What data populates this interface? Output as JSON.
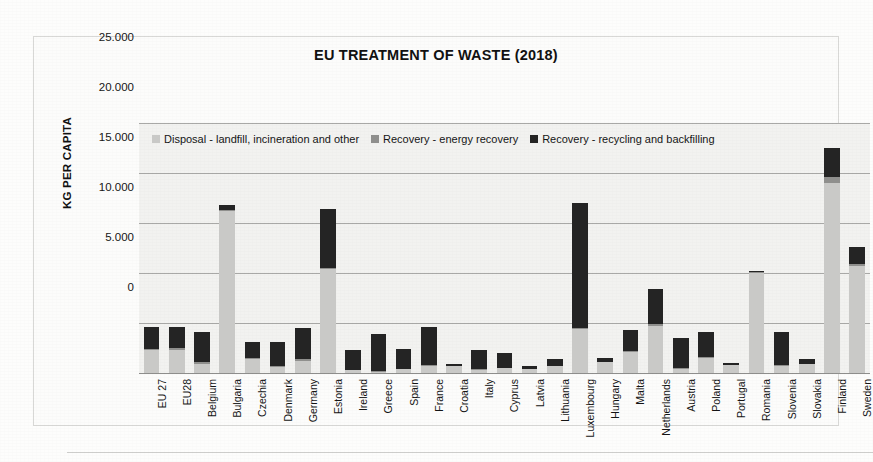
{
  "chart_data": {
    "type": "bar",
    "subtype": "stacked-column",
    "title": "EU TREATMENT OF WASTE (2018)",
    "xlabel": "",
    "ylabel": "KG PER CAPITA",
    "ylim": [
      0,
      25000
    ],
    "yticks": [
      0,
      5000,
      10000,
      15000,
      20000,
      25000
    ],
    "ytick_labels": [
      "0",
      "5.000",
      "10.000",
      "15.000",
      "20.000",
      "25.000"
    ],
    "grid": true,
    "legend_position": "top-left-inside",
    "categories": [
      "EU 27",
      "EU28",
      "Belgium",
      "Bulgaria",
      "Czechia",
      "Denmark",
      "Germany",
      "Estonia",
      "Ireland",
      "Greece",
      "Spain",
      "France",
      "Croatia",
      "Italy",
      "Cyprus",
      "Latvia",
      "Lithuania",
      "Luxembourg",
      "Hungary",
      "Malta",
      "Netherlands",
      "Austria",
      "Poland",
      "Portugal",
      "Romania",
      "Slovenia",
      "Slovakia",
      "Finland",
      "Sweden"
    ],
    "series": [
      {
        "name": "Disposal - landfill, incineration and other",
        "color": "#c9c9c7",
        "values": [
          2300,
          2350,
          900,
          16200,
          1400,
          600,
          1200,
          10400,
          300,
          150,
          400,
          700,
          700,
          350,
          500,
          400,
          700,
          4400,
          1100,
          2100,
          4700,
          400,
          1500,
          800,
          10000,
          700,
          900,
          19000,
          10700
        ]
      },
      {
        "name": "Recovery - energy recovery",
        "color": "#8f8f8d",
        "values": [
          150,
          120,
          250,
          100,
          60,
          150,
          180,
          120,
          40,
          30,
          50,
          150,
          30,
          40,
          40,
          30,
          40,
          120,
          50,
          60,
          200,
          60,
          80,
          30,
          150,
          60,
          40,
          600,
          250
        ]
      },
      {
        "name": "Recovery - recycling and backfilling",
        "color": "#242424",
        "values": [
          2200,
          2130,
          3000,
          500,
          1600,
          2350,
          3150,
          5900,
          2000,
          3750,
          2000,
          3800,
          150,
          1950,
          1450,
          300,
          700,
          12500,
          350,
          2150,
          3500,
          3050,
          2550,
          150,
          50,
          3300,
          500,
          2900,
          1650
        ]
      }
    ]
  },
  "legend": {
    "items": [
      {
        "label": "Disposal - landfill, incineration and other",
        "color": "#c9c9c7"
      },
      {
        "label": "Recovery - energy recovery",
        "color": "#8f8f8d"
      },
      {
        "label": "Recovery - recycling and backfilling",
        "color": "#242424"
      }
    ]
  }
}
